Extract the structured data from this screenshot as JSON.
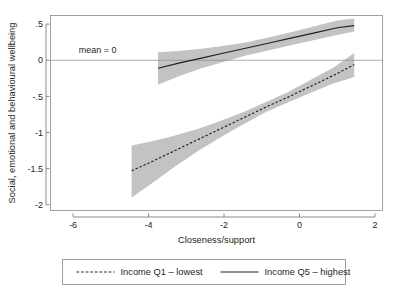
{
  "chart_data": {
    "type": "line",
    "title": "",
    "xlabel": "Closeness/support",
    "ylabel": "Social, emotional and behavioural wellbeing",
    "xlim": [
      -6.6,
      2.2
    ],
    "ylim": [
      -2.08,
      0.62
    ],
    "xticks": [
      -6,
      -4,
      -2,
      0,
      2
    ],
    "xticklabels": [
      "-6",
      "-4",
      "-2",
      "0",
      "2"
    ],
    "yticks": [
      0.5,
      0,
      -0.5,
      -1,
      -1.5,
      -2
    ],
    "yticklabels": [
      ".5",
      "0",
      "-.5",
      "-1",
      "-1.5",
      "-2"
    ],
    "grid": false,
    "legend_position": "below",
    "reference_lines": [
      {
        "name": "mean-zero-line",
        "orientation": "horizontal",
        "y": 0,
        "label": "mean = 0",
        "label_x": -5.85,
        "label_y": 0.1
      }
    ],
    "series": [
      {
        "name": "Income Q1 - lowest",
        "style": "dashed",
        "color": "#231f20",
        "x": [
          -4.45,
          -3.9,
          -3.3,
          -2.7,
          -2.1,
          -1.5,
          -0.9,
          -0.3,
          0.3,
          0.9,
          1.45
        ],
        "y": [
          -1.53,
          -1.4,
          -1.25,
          -1.1,
          -0.95,
          -0.8,
          -0.65,
          -0.51,
          -0.36,
          -0.21,
          -0.06
        ],
        "band_lower": [
          -1.9,
          -1.7,
          -1.47,
          -1.26,
          -1.07,
          -0.89,
          -0.72,
          -0.58,
          -0.45,
          -0.32,
          -0.23
        ],
        "band_upper": [
          -1.18,
          -1.12,
          -1.04,
          -0.95,
          -0.84,
          -0.72,
          -0.58,
          -0.44,
          -0.27,
          -0.1,
          0.1
        ],
        "band_color": "#b9b9b9"
      },
      {
        "name": "Income Q5 - highest",
        "style": "solid",
        "color": "#231f20",
        "x": [
          -3.75,
          -3.2,
          -2.6,
          -2.0,
          -1.4,
          -0.8,
          -0.2,
          0.4,
          1.0,
          1.45
        ],
        "y": [
          -0.11,
          -0.04,
          0.03,
          0.1,
          0.17,
          0.24,
          0.31,
          0.38,
          0.45,
          0.48
        ],
        "band_lower": [
          -0.34,
          -0.22,
          -0.11,
          -0.02,
          0.07,
          0.14,
          0.21,
          0.28,
          0.35,
          0.4
        ],
        "band_upper": [
          0.11,
          0.13,
          0.16,
          0.2,
          0.25,
          0.32,
          0.39,
          0.47,
          0.55,
          0.58
        ],
        "band_color": "#b9b9b9"
      }
    ]
  },
  "legend": {
    "entries": [
      {
        "label": "Income Q1 – lowest",
        "style": "dashed"
      },
      {
        "label": "Income Q5 – highest",
        "style": "solid"
      }
    ]
  }
}
